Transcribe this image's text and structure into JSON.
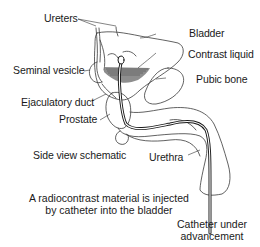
{
  "diagram": {
    "labels": {
      "ureters": "Ureters",
      "bladder": "Bladder",
      "contrast_liquid": "Contrast liquid",
      "seminal_vesicle": "Seminal vesicle",
      "pubic_bone": "Pubic bone",
      "ejaculatory_duct": "Ejaculatory duct",
      "prostate": "Prostate",
      "side_view": "Side view schematic",
      "urethra": "Urethra",
      "catheter_line1": "Catheter under",
      "catheter_line2": "advancement"
    },
    "caption": {
      "line1": "A radiocontrast material is injected",
      "line2": "by catheter into the bladder"
    },
    "colors": {
      "line": "#2a2a2a",
      "contrast_fill": "#7a7a7a",
      "background": "#ffffff"
    }
  }
}
